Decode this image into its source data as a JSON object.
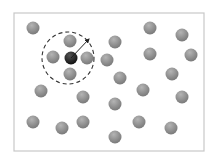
{
  "diagram": {
    "frame": {
      "x": 14,
      "y": 13,
      "width": 190,
      "height": 138,
      "stroke": "#c8c8c8"
    },
    "colors": {
      "particle_light": "#b4b4b4",
      "particle_dark": "#7a7a7a",
      "center_light": "#555555",
      "center_dark": "#111111",
      "cutoff_stroke": "#333333",
      "arrow": "#222222"
    },
    "particle_radius": 6.5,
    "center_particle": {
      "x": 71,
      "y": 58
    },
    "cutoff_circle": {
      "cx": 68,
      "cy": 58,
      "r": 26
    },
    "radius_arrow": {
      "x1": 71,
      "y1": 58,
      "x2": 89,
      "y2": 39
    },
    "particles": [
      {
        "x": 33,
        "y": 28
      },
      {
        "x": 70,
        "y": 41
      },
      {
        "x": 53,
        "y": 57
      },
      {
        "x": 87,
        "y": 58
      },
      {
        "x": 70,
        "y": 74
      },
      {
        "x": 107,
        "y": 60
      },
      {
        "x": 150,
        "y": 28
      },
      {
        "x": 182,
        "y": 35
      },
      {
        "x": 115,
        "y": 42
      },
      {
        "x": 150,
        "y": 54
      },
      {
        "x": 191,
        "y": 55
      },
      {
        "x": 172,
        "y": 74
      },
      {
        "x": 120,
        "y": 78
      },
      {
        "x": 143,
        "y": 90
      },
      {
        "x": 182,
        "y": 97
      },
      {
        "x": 41,
        "y": 91
      },
      {
        "x": 83,
        "y": 97
      },
      {
        "x": 115,
        "y": 104
      },
      {
        "x": 33,
        "y": 122
      },
      {
        "x": 62,
        "y": 128
      },
      {
        "x": 83,
        "y": 122
      },
      {
        "x": 139,
        "y": 122
      },
      {
        "x": 171,
        "y": 128
      },
      {
        "x": 115,
        "y": 137
      }
    ]
  }
}
